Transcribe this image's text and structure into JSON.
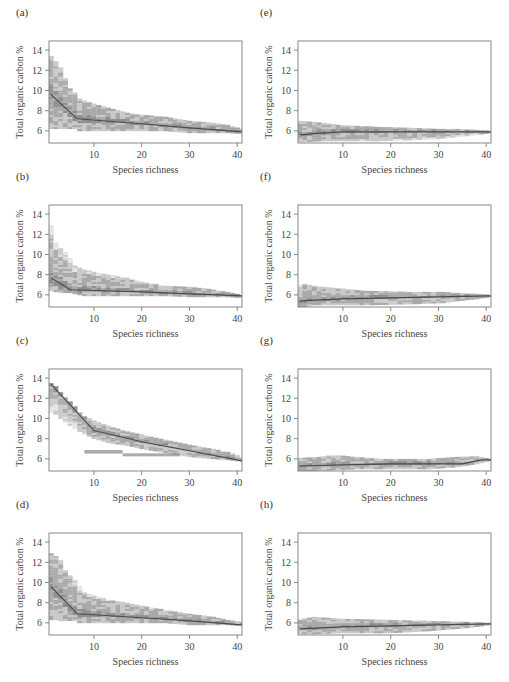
{
  "figure": {
    "xlabel": "Species richness",
    "ylabel": "Total organic carbon %"
  },
  "colors": {
    "frame": "#7a7a7a",
    "band_dark": "#8f8f8f",
    "band_mid": "#a9a9a9",
    "band_light": "#c9c9c9",
    "band_pale": "#e4e4e4",
    "mean_line": "#4a4a4a"
  },
  "chart_data": [
    {
      "id": "a",
      "label": "(a)",
      "type": "heatmap",
      "title": "",
      "xlabel": "Species richness",
      "ylabel": "Total organic carbon %",
      "xlim": [
        0.6,
        41
      ],
      "ylim": [
        4.8,
        14.9
      ],
      "xticks": [
        10,
        20,
        30,
        40
      ],
      "yticks": [
        6,
        8,
        10,
        12,
        14
      ],
      "mean_line": {
        "x": [
          1,
          6.5,
          20,
          30,
          41
        ],
        "y": [
          9.6,
          7.2,
          6.7,
          6.3,
          5.9
        ]
      },
      "envelope": {
        "x": [
          1,
          2,
          3,
          4,
          5,
          6,
          7,
          10,
          13,
          17,
          20,
          25,
          30,
          35,
          38,
          41
        ],
        "upper": [
          13.4,
          12.9,
          12.3,
          11.2,
          10.2,
          9.8,
          9.2,
          8.7,
          8.3,
          7.8,
          7.6,
          7.4,
          7.0,
          6.8,
          6.6,
          6.2
        ],
        "lower": [
          6.2,
          6.2,
          6.2,
          6.2,
          6.2,
          6.2,
          6.0,
          6.0,
          6.0,
          6.0,
          6.0,
          6.0,
          5.8,
          5.8,
          5.8,
          5.7
        ]
      }
    },
    {
      "id": "b",
      "label": "(b)",
      "type": "heatmap",
      "title": "",
      "xlabel": "Species richness",
      "ylabel": "Total organic carbon %",
      "xlim": [
        0.6,
        41
      ],
      "ylim": [
        4.8,
        14.9
      ],
      "xticks": [
        10,
        20,
        30,
        40
      ],
      "yticks": [
        6,
        8,
        10,
        12,
        14
      ],
      "mean_line": {
        "x": [
          1,
          5,
          20,
          30,
          41
        ],
        "y": [
          7.7,
          6.5,
          6.3,
          6.1,
          5.9
        ]
      },
      "envelope": {
        "x": [
          1,
          2,
          3,
          4,
          5,
          6,
          8,
          10,
          13,
          17,
          20,
          25,
          30,
          34,
          38,
          41
        ],
        "upper": [
          12.9,
          11.2,
          10.6,
          10.2,
          9.6,
          8.9,
          8.5,
          8.3,
          8.0,
          7.7,
          7.3,
          6.9,
          6.8,
          6.6,
          6.3,
          6.0
        ],
        "lower": [
          6.4,
          6.3,
          6.2,
          6.2,
          6.2,
          6.1,
          5.9,
          5.9,
          5.9,
          5.9,
          5.9,
          5.9,
          5.8,
          5.8,
          5.8,
          5.7
        ]
      }
    },
    {
      "id": "c",
      "label": "(c)",
      "type": "heatmap",
      "title": "",
      "xlabel": "Species richness",
      "ylabel": "Total organic carbon %",
      "xlim": [
        0.6,
        41
      ],
      "ylim": [
        4.8,
        14.9
      ],
      "xticks": [
        10,
        20,
        30,
        40
      ],
      "yticks": [
        6,
        8,
        10,
        12,
        14
      ],
      "mean_line": {
        "x": [
          1,
          10,
          20,
          30,
          41
        ],
        "y": [
          13.4,
          8.8,
          7.7,
          6.8,
          5.8
        ]
      },
      "envelope": {
        "x": [
          1,
          2,
          3,
          4,
          5,
          6,
          7,
          8,
          10,
          13,
          17,
          20,
          25,
          30,
          35,
          38,
          41
        ],
        "upper": [
          13.5,
          13.2,
          12.6,
          12.1,
          11.7,
          11.2,
          10.6,
          10.2,
          9.8,
          9.3,
          8.7,
          8.4,
          7.9,
          7.4,
          7.0,
          6.7,
          6.2
        ],
        "lower": [
          10.6,
          10.4,
          10.0,
          9.6,
          9.3,
          9.0,
          8.7,
          8.4,
          8.0,
          7.6,
          7.3,
          7.0,
          6.6,
          6.2,
          6.0,
          5.9,
          5.7
        ]
      },
      "extra_bands": [
        {
          "x0": 8,
          "x1": 16,
          "y": 6.7,
          "h": 0.35
        },
        {
          "x0": 16,
          "x1": 28,
          "y": 6.4,
          "h": 0.3
        }
      ]
    },
    {
      "id": "d",
      "label": "(d)",
      "type": "heatmap",
      "title": "",
      "xlabel": "Species richness",
      "ylabel": "Total organic carbon %",
      "xlim": [
        0.6,
        41
      ],
      "ylim": [
        4.8,
        14.9
      ],
      "xticks": [
        10,
        20,
        30,
        40
      ],
      "yticks": [
        6,
        8,
        10,
        12,
        14
      ],
      "mean_line": {
        "x": [
          1,
          6.5,
          20,
          30,
          41
        ],
        "y": [
          9.6,
          6.9,
          6.5,
          6.2,
          5.8
        ]
      },
      "envelope": {
        "x": [
          1,
          2,
          3,
          4,
          5,
          6,
          7,
          8,
          10,
          13,
          17,
          20,
          25,
          30,
          35,
          38,
          41
        ],
        "upper": [
          12.9,
          12.6,
          12.2,
          11.2,
          10.7,
          10.3,
          9.6,
          9.0,
          8.7,
          8.3,
          8.0,
          7.7,
          7.3,
          6.9,
          6.6,
          6.3,
          6.1
        ],
        "lower": [
          6.3,
          6.3,
          6.2,
          6.2,
          6.2,
          6.2,
          6.0,
          6.0,
          6.0,
          6.0,
          6.0,
          6.0,
          6.0,
          5.8,
          5.8,
          5.8,
          5.7
        ]
      }
    },
    {
      "id": "e",
      "label": "(e)",
      "type": "heatmap",
      "title": "",
      "xlabel": "Species richness",
      "ylabel": "Total organic carbon %",
      "xlim": [
        0.6,
        41
      ],
      "ylim": [
        4.8,
        14.9
      ],
      "xticks": [
        10,
        20,
        30,
        40
      ],
      "yticks": [
        6,
        8,
        10,
        12,
        14
      ],
      "mean_line": {
        "x": [
          1,
          6,
          10,
          20,
          30,
          41
        ],
        "y": [
          5.6,
          5.8,
          5.9,
          5.9,
          5.9,
          5.9
        ]
      },
      "envelope": {
        "x": [
          1,
          6,
          9,
          17,
          25,
          30,
          34,
          38,
          41
        ],
        "upper": [
          7.0,
          6.8,
          6.6,
          6.4,
          6.3,
          6.2,
          6.2,
          6.1,
          6.0
        ],
        "lower": [
          4.9,
          5.0,
          5.0,
          5.0,
          5.1,
          5.2,
          5.4,
          5.6,
          5.8
        ]
      }
    },
    {
      "id": "f",
      "label": "(f)",
      "type": "heatmap",
      "title": "",
      "xlabel": "Species richness",
      "ylabel": "Total organic carbon %",
      "xlim": [
        0.6,
        41
      ],
      "ylim": [
        4.8,
        14.9
      ],
      "xticks": [
        10,
        20,
        30,
        40
      ],
      "yticks": [
        6,
        8,
        10,
        12,
        14
      ],
      "mean_line": {
        "x": [
          1,
          10,
          20,
          30,
          41
        ],
        "y": [
          5.4,
          5.6,
          5.7,
          5.8,
          5.9
        ]
      },
      "envelope": {
        "x": [
          1,
          2,
          4,
          8,
          15,
          25,
          31,
          34,
          38,
          41
        ],
        "upper": [
          7.0,
          7.1,
          6.9,
          6.7,
          6.4,
          6.3,
          6.3,
          6.2,
          6.1,
          6.0
        ],
        "lower": [
          4.8,
          4.8,
          5.0,
          5.0,
          5.0,
          5.1,
          5.2,
          5.4,
          5.6,
          5.8
        ]
      }
    },
    {
      "id": "g",
      "label": "(g)",
      "type": "heatmap",
      "title": "",
      "xlabel": "Species richness",
      "ylabel": "Total organic carbon %",
      "xlim": [
        0.6,
        41
      ],
      "ylim": [
        4.8,
        14.9
      ],
      "xticks": [
        10,
        20,
        30,
        40
      ],
      "yticks": [
        6,
        8,
        10,
        12,
        14
      ],
      "mean_line": {
        "x": [
          1,
          10,
          20,
          30,
          35,
          39,
          41
        ],
        "y": [
          5.3,
          5.4,
          5.5,
          5.5,
          5.5,
          5.9,
          5.9
        ]
      },
      "envelope": {
        "x": [
          1,
          5,
          8,
          13,
          18,
          28,
          34,
          38,
          41
        ],
        "upper": [
          6.1,
          6.2,
          6.4,
          6.2,
          6.0,
          6.0,
          6.2,
          6.3,
          6.0
        ],
        "lower": [
          4.8,
          4.8,
          4.9,
          5.0,
          5.0,
          5.0,
          5.2,
          5.5,
          5.8
        ]
      }
    },
    {
      "id": "h",
      "label": "(h)",
      "type": "heatmap",
      "title": "",
      "xlabel": "Species richness",
      "ylabel": "Total organic carbon %",
      "xlim": [
        0.6,
        41
      ],
      "ylim": [
        4.8,
        14.9
      ],
      "xticks": [
        10,
        20,
        30,
        40
      ],
      "yticks": [
        6,
        8,
        10,
        12,
        14
      ],
      "mean_line": {
        "x": [
          1,
          10,
          20,
          30,
          41
        ],
        "y": [
          5.4,
          5.6,
          5.7,
          5.8,
          5.9
        ]
      },
      "envelope": {
        "x": [
          1,
          4,
          10,
          20,
          28,
          36,
          41
        ],
        "upper": [
          6.4,
          6.6,
          6.4,
          6.3,
          6.2,
          6.1,
          6.0
        ],
        "lower": [
          4.9,
          4.9,
          5.0,
          5.0,
          5.2,
          5.5,
          5.8
        ]
      }
    }
  ]
}
